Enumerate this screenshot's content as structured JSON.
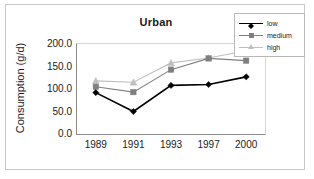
{
  "chart_data": {
    "type": "line",
    "title": "Urban",
    "xlabel": "",
    "ylabel": "Consumption (g/d)",
    "categories": [
      "1989",
      "1991",
      "1993",
      "1997",
      "2000"
    ],
    "ylim": [
      0,
      200
    ],
    "yticks": [
      "0.0",
      "50.0",
      "100.0",
      "150.0",
      "200.0"
    ],
    "ytick_values": [
      0,
      50,
      100,
      150,
      200
    ],
    "grid": false,
    "legend_position": "top-right",
    "series": [
      {
        "name": "low",
        "color": "#000000",
        "marker": "diamond",
        "values": [
          92,
          50,
          108,
          110,
          127
        ]
      },
      {
        "name": "medium",
        "color": "#7f7f7f",
        "marker": "square",
        "values": [
          105,
          93,
          143,
          168,
          163
        ]
      },
      {
        "name": "high",
        "color": "#bfbfbf",
        "marker": "triangle",
        "values": [
          118,
          115,
          158,
          169,
          185
        ]
      }
    ]
  }
}
